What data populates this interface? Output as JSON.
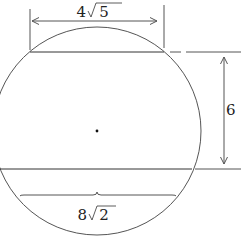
{
  "diagram": {
    "top_chord": {
      "length_label_coef": "4",
      "length_label_rad": "5",
      "length_label": "4√5"
    },
    "bottom_chord": {
      "length_label_coef": "8",
      "length_label_rad": "2",
      "length_label": "8√2"
    },
    "chord_distance": {
      "label": "6"
    },
    "center_marker": "dot",
    "colors": {
      "stroke": "#555555",
      "text": "#222222"
    }
  }
}
